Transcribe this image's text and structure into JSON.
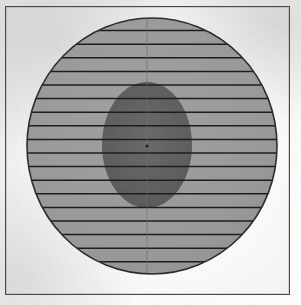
{
  "figure": {
    "title": "",
    "caption": "",
    "type": "hatched-circle-with-inner-ellipse",
    "frame": {
      "name": "plot-frame",
      "x": 5,
      "y": 6,
      "width": 285,
      "height": 289,
      "border_color": "#4a4a4a",
      "border_width": 1
    },
    "background": {
      "base_color": "#f4f4f2",
      "highlight_color": "#ffffff",
      "shadow_color": "#d8d8d6"
    }
  },
  "chart_data": {
    "type": "scatter",
    "title": "",
    "subtitle": "",
    "xlabel": "",
    "ylabel": "",
    "grid": true,
    "legend": null,
    "xlim": [
      0,
      283
    ],
    "ylim": [
      0,
      287
    ],
    "shapes": [
      {
        "name": "outer-circle",
        "kind": "circle",
        "cx": 146,
        "cy": 139,
        "rx": 125,
        "ry": 128,
        "fill": "#9a9a9a",
        "stroke": "#2e2e2e",
        "stroke_width": 1.6,
        "label": "outer boundary region"
      },
      {
        "name": "inner-ellipse",
        "kind": "ellipse",
        "cx": 141,
        "cy": 138,
        "rx": 45,
        "ry": 63,
        "fill": "#5f5f5f",
        "stroke": "none",
        "stroke_width": 0,
        "label": "inner dense region"
      }
    ],
    "hatch": {
      "name": "horizontal-hatch-lines",
      "orientation": "horizontal",
      "count": 20,
      "spacing": 13.6,
      "first_y": 10,
      "color": "#1e1e1e",
      "line_width": 1.5,
      "y_values": [
        10,
        23.6,
        37.2,
        50.8,
        64.4,
        78,
        91.6,
        105.2,
        118.8,
        132.4,
        146,
        159.6,
        173.2,
        186.8,
        200.4,
        214,
        227.6,
        241.2,
        254.8,
        268.4
      ]
    },
    "axis_line": {
      "name": "vertical-center-line",
      "orientation": "vertical",
      "x": 141,
      "y_start": 11,
      "y_end": 268,
      "color": "#6b6b6b",
      "line_width": 0.8
    },
    "center_marker": {
      "name": "center-point-marker",
      "x": 141,
      "y": 139,
      "color": "#1a1a1a",
      "size": 2.5
    },
    "colors": {
      "outer_fill": "#9a9a9a",
      "inner_fill": "#5f5f5f",
      "hatch": "#1e1e1e",
      "outline": "#2e2e2e",
      "frame": "#4a4a4a",
      "paper": "#f4f4f2"
    }
  }
}
